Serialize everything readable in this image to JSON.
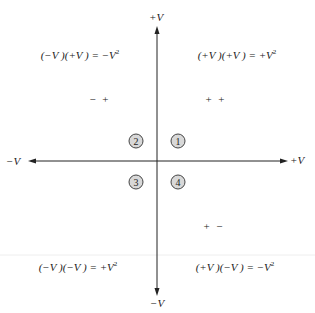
{
  "axes": {
    "y_top_label": "+V",
    "y_bottom_label": "−V",
    "x_left_label": "−V",
    "x_right_label": "+V"
  },
  "quadrants": [
    {
      "number": "1",
      "signs": "+ +",
      "equation": "(+V )(+V )  =  +V",
      "exponent": "2"
    },
    {
      "number": "2",
      "signs": "− +",
      "equation": "(−V )(+V )  =  −V",
      "exponent": "2"
    },
    {
      "number": "3",
      "signs": "",
      "equation": "(−V )(−V )  =  +V",
      "exponent": "2"
    },
    {
      "number": "4",
      "signs": "+ −",
      "equation": "(+V )(−V )  =  −V",
      "exponent": "2"
    }
  ],
  "colors": {
    "axis": "#222222",
    "badge_fill": "#d8d8d8",
    "badge_border": "#444444",
    "divider": "#eeeeee"
  }
}
